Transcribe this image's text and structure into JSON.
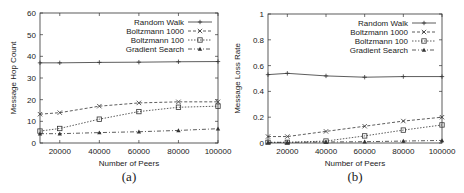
{
  "chart_data": [
    {
      "type": "line",
      "panel_label": "(a)",
      "title": "",
      "xlabel": "Number of Peers",
      "ylabel": "Message Hop Count",
      "x": [
        10000,
        20000,
        40000,
        60000,
        80000,
        100000
      ],
      "xlim": [
        10000,
        100000
      ],
      "ylim": [
        0,
        60
      ],
      "xticks": [
        "20000",
        "40000",
        "60000",
        "80000",
        "100000"
      ],
      "yticks": [
        "0",
        "10",
        "20",
        "30",
        "40",
        "50",
        "60"
      ],
      "grid": false,
      "legend_position": "top-right",
      "series": [
        {
          "name": "Random Walk",
          "marker": "plus",
          "dash": "solid",
          "values": [
            37,
            37,
            37.2,
            37.3,
            37.5,
            37.6
          ]
        },
        {
          "name": "Boltzmann 1000",
          "marker": "x",
          "dash": "dashed",
          "values": [
            13.3,
            14,
            17,
            18.5,
            19,
            19
          ]
        },
        {
          "name": "Boltzmann 100",
          "marker": "square",
          "dash": "dotted",
          "values": [
            5.5,
            6.7,
            11,
            14.5,
            16.5,
            17
          ]
        },
        {
          "name": "Gradient Search",
          "marker": "triangle",
          "dash": "dashdot",
          "values": [
            4.3,
            4.3,
            4.8,
            5.2,
            5.8,
            6.6
          ]
        }
      ]
    },
    {
      "type": "line",
      "panel_label": "(b)",
      "title": "",
      "xlabel": "Number of Peers",
      "ylabel": "Message Loss Rate",
      "x": [
        10000,
        20000,
        40000,
        60000,
        80000,
        100000
      ],
      "xlim": [
        10000,
        100000
      ],
      "ylim": [
        0,
        1
      ],
      "xticks": [
        "20000",
        "40000",
        "60000",
        "80000",
        "100000"
      ],
      "yticks": [
        "0",
        "0.2",
        "0.4",
        "0.6",
        "0.8",
        "1"
      ],
      "grid": false,
      "legend_position": "top-right",
      "series": [
        {
          "name": "Random Walk",
          "marker": "plus",
          "dash": "solid",
          "values": [
            0.53,
            0.54,
            0.52,
            0.51,
            0.515,
            0.515
          ]
        },
        {
          "name": "Boltzmann 1000",
          "marker": "x",
          "dash": "dashed",
          "values": [
            0.05,
            0.05,
            0.09,
            0.13,
            0.17,
            0.2
          ]
        },
        {
          "name": "Boltzmann 100",
          "marker": "square",
          "dash": "dotted",
          "values": [
            0.005,
            0.005,
            0.015,
            0.055,
            0.1,
            0.14
          ]
        },
        {
          "name": "Gradient Search",
          "marker": "triangle",
          "dash": "dashdot",
          "values": [
            0.005,
            0.005,
            0.008,
            0.01,
            0.015,
            0.02
          ]
        }
      ]
    }
  ],
  "captions": {
    "a": "(a)",
    "b": "(b)"
  }
}
